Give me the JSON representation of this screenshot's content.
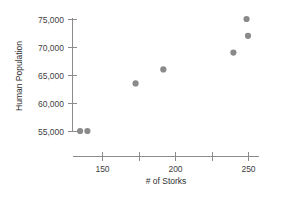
{
  "chart_data": {
    "type": "scatter",
    "title": "",
    "xlabel": "# of Storks",
    "ylabel": "Human Population",
    "xlim": [
      128,
      258
    ],
    "ylim": [
      53200,
      76400
    ],
    "grid": false,
    "legend": null,
    "x_ticks": [
      150,
      175,
      200,
      225,
      250
    ],
    "x_tick_labels": [
      "150",
      "",
      "200",
      "",
      "250"
    ],
    "y_ticks": [
      55000,
      60000,
      65000,
      70000,
      75000
    ],
    "y_tick_labels": [
      "55,000",
      "60,000",
      "65,000",
      "70,000",
      "75,000"
    ],
    "marker": {
      "shape": "circle",
      "color": "#8a8a8a",
      "size": 3.1
    },
    "points": [
      {
        "x": 135,
        "y": 55000
      },
      {
        "x": 140,
        "y": 55000
      },
      {
        "x": 173,
        "y": 63500
      },
      {
        "x": 192,
        "y": 66000
      },
      {
        "x": 240,
        "y": 69000
      },
      {
        "x": 250,
        "y": 72000
      },
      {
        "x": 249,
        "y": 75000
      }
    ]
  },
  "axes": {
    "y_title": "Human Population",
    "x_title": "# of Storks"
  }
}
